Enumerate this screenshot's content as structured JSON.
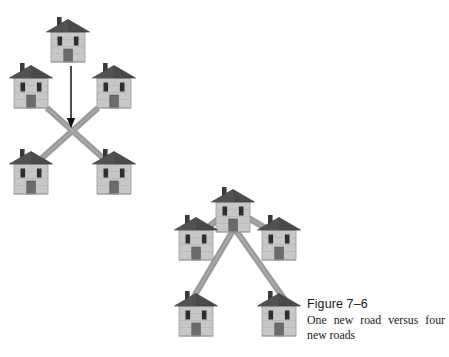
{
  "figure": {
    "number_label": "Figure 7–6",
    "caption": "One new road versus four new roads",
    "background_color": "#ffffff"
  },
  "palette": {
    "roof": "#4a4a4a",
    "roof_dark": "#3c3c3c",
    "wall": "#c9c9c9",
    "wall_shade": "#b4b4b4",
    "window": "#2e2e2e",
    "door": "#6b6b6b",
    "chimney": "#3a3a3a",
    "road": "#9a9a9a",
    "road_edge": "#8a8a8a",
    "arrow": "#111111",
    "outline": "#707070",
    "text": "#1a1a1a"
  },
  "diagrams": [
    {
      "id": "left-diagram",
      "name": "one-new-road-diagram",
      "description": "Four houses connected by two crossing roads, with an arrow pointing down from a fifth house indicating one new road",
      "house_count": 5,
      "road_count": 2,
      "arrow_count": 1,
      "houses": [
        {
          "id": "left-house-top",
          "label": "top house",
          "x": 68,
          "y": 42
        },
        {
          "id": "left-house-upper-left",
          "label": "upper left house",
          "x": 31,
          "y": 88
        },
        {
          "id": "left-house-upper-right",
          "label": "upper right house",
          "x": 114,
          "y": 88
        },
        {
          "id": "left-house-lower-left",
          "label": "lower left house",
          "x": 31,
          "y": 174
        },
        {
          "id": "left-house-lower-right",
          "label": "lower right house",
          "x": 114,
          "y": 174
        }
      ],
      "roads": [
        {
          "id": "left-road-1",
          "from": "left-house-upper-left",
          "to": "left-house-lower-right"
        },
        {
          "id": "left-road-2",
          "from": "left-house-upper-right",
          "to": "left-house-lower-left"
        }
      ],
      "arrows": [
        {
          "id": "left-arrow-down",
          "x1": 71,
          "y1": 66,
          "x2": 71,
          "y2": 127
        }
      ]
    },
    {
      "id": "right-diagram",
      "name": "four-new-roads-diagram",
      "description": "A top house joined by four new roads to four surrounding houses",
      "house_count": 5,
      "road_count": 4,
      "arrow_count": 0,
      "houses": [
        {
          "id": "right-house-top",
          "label": "top house",
          "x": 233,
          "y": 212
        },
        {
          "id": "right-house-upper-left",
          "label": "upper left house",
          "x": 196,
          "y": 240
        },
        {
          "id": "right-house-upper-right",
          "label": "upper right house",
          "x": 279,
          "y": 240
        },
        {
          "id": "right-house-lower-left",
          "label": "lower left house",
          "x": 196,
          "y": 316
        },
        {
          "id": "right-house-lower-right",
          "label": "lower right house",
          "x": 279,
          "y": 316
        }
      ],
      "roads": [
        {
          "id": "right-road-1",
          "from": "right-house-top",
          "to": "right-house-upper-left"
        },
        {
          "id": "right-road-2",
          "from": "right-house-top",
          "to": "right-house-upper-right"
        },
        {
          "id": "right-road-3",
          "from": "right-house-top",
          "to": "right-house-lower-right"
        },
        {
          "id": "right-road-4",
          "from": "right-house-top",
          "to": "right-house-lower-left"
        }
      ],
      "arrows": []
    }
  ]
}
